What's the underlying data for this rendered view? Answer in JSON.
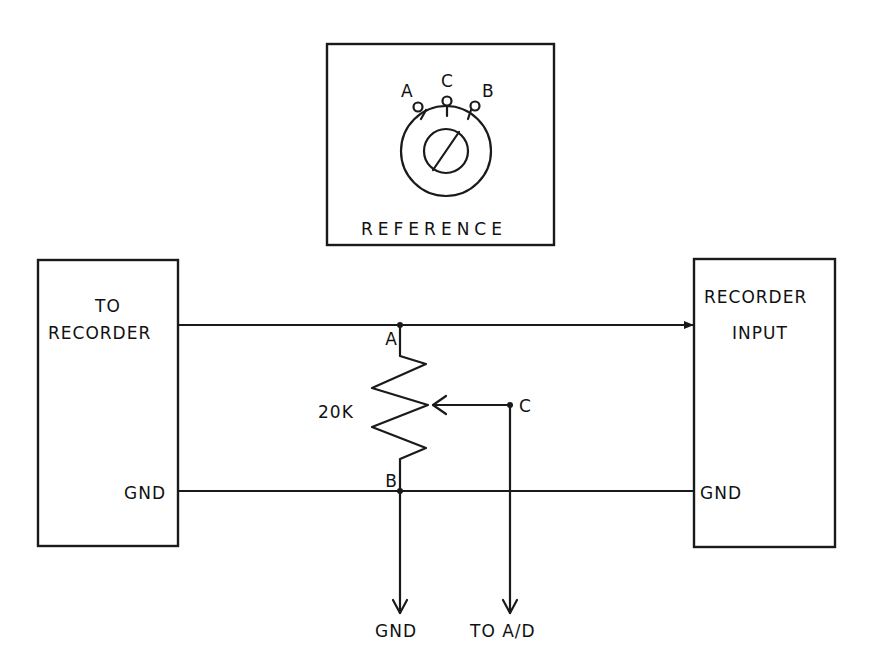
{
  "diagram": {
    "type": "circuit-schematic",
    "reference_inset": {
      "title": "REFERENCE",
      "terminals": [
        "A",
        "C",
        "B"
      ]
    },
    "left_box": {
      "label_line1": "TO",
      "label_line2": "RECORDER",
      "gnd_label": "GND"
    },
    "right_box": {
      "label_line1": "RECORDER",
      "label_line2": "INPUT",
      "gnd_label": "GND"
    },
    "potentiometer": {
      "value": "20K",
      "terminal_a": "A",
      "terminal_b": "B",
      "wiper": "C"
    },
    "outputs": {
      "gnd": "GND",
      "to_ad": "TO A/D"
    },
    "colors": {
      "ink": "#1a1a1a",
      "background": "#ffffff"
    }
  }
}
